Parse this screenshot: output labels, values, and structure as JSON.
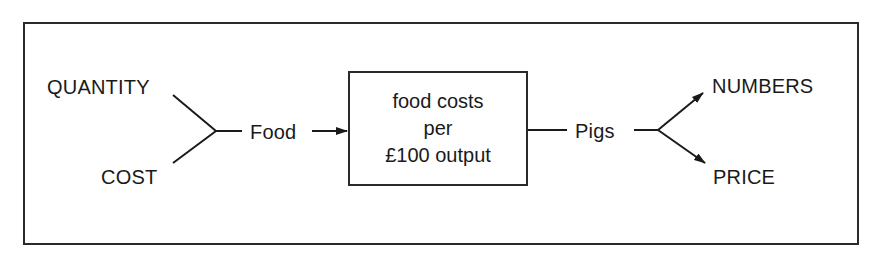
{
  "diagram": {
    "inputs": [
      {
        "label": "QUANTITY"
      },
      {
        "label": "COST"
      }
    ],
    "input_node": {
      "label": "Food"
    },
    "process_box": {
      "lines": [
        "food costs",
        "per",
        "£100 output"
      ]
    },
    "output_node": {
      "label": "Pigs"
    },
    "outputs": [
      {
        "label": "NUMBERS"
      },
      {
        "label": "PRICE"
      }
    ],
    "colors": {
      "line": "#1a1a1a",
      "background": "#ffffff"
    }
  }
}
